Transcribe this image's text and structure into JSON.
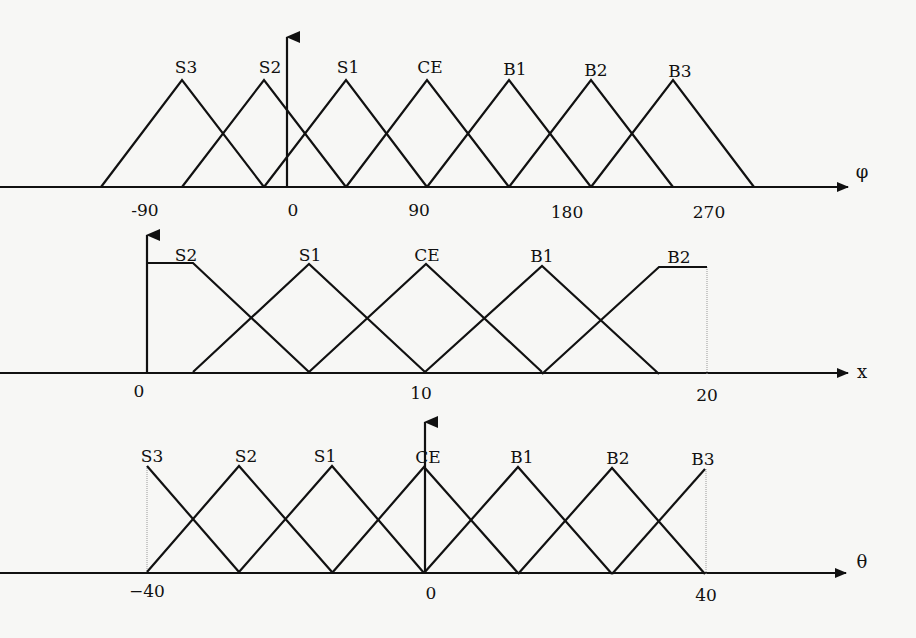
{
  "colors": {
    "line": "#111111",
    "background": "#f7f7f5",
    "guide": "#999999"
  },
  "chart_data": [
    {
      "type": "membership-functions",
      "variable": "phi",
      "axis_label": "φ",
      "ticks": [
        {
          "label": "-90",
          "x": 145,
          "y": 216
        },
        {
          "label": "0",
          "x": 293,
          "y": 216
        },
        {
          "label": "90",
          "x": 419,
          "y": 216
        },
        {
          "label": "180",
          "x": 567,
          "y": 218
        },
        {
          "label": "270",
          "x": 709,
          "y": 218
        }
      ],
      "sets": [
        {
          "name": "S3",
          "points": [
            [
              101,
              187
            ],
            [
              182,
              80
            ],
            [
              264,
              187
            ]
          ]
        },
        {
          "name": "S2",
          "points": [
            [
              182,
              187
            ],
            [
              264,
              80
            ],
            [
              346,
              187
            ]
          ]
        },
        {
          "name": "S1",
          "points": [
            [
              264,
              187
            ],
            [
              346,
              80
            ],
            [
              427,
              187
            ]
          ]
        },
        {
          "name": "CE",
          "points": [
            [
              346,
              187
            ],
            [
              427,
              80
            ],
            [
              509,
              187
            ]
          ]
        },
        {
          "name": "B1",
          "points": [
            [
              427,
              187
            ],
            [
              509,
              80
            ],
            [
              591,
              187
            ]
          ]
        },
        {
          "name": "B2",
          "points": [
            [
              509,
              187
            ],
            [
              591,
              80
            ],
            [
              673,
              187
            ]
          ]
        },
        {
          "name": "B3",
          "points": [
            [
              591,
              187
            ],
            [
              673,
              80
            ],
            [
              754,
              187
            ]
          ]
        }
      ],
      "axis": {
        "y": 187,
        "x_start": 0,
        "x_end": 848,
        "yaxis_x": 287,
        "yaxis_top": 35
      },
      "axis_label_pos": {
        "x": 862,
        "y": 178
      }
    },
    {
      "type": "membership-functions",
      "variable": "x",
      "axis_label": "x",
      "ticks": [
        {
          "label": "0",
          "x": 139,
          "y": 397
        },
        {
          "label": "10",
          "x": 421,
          "y": 399
        },
        {
          "label": "20",
          "x": 707,
          "y": 401
        }
      ],
      "sets": [
        {
          "name": "S2",
          "points": [
            [
              147,
              263
            ],
            [
              193,
              263
            ],
            [
              309,
              372
            ]
          ],
          "label_x": 186
        },
        {
          "name": "S1",
          "points": [
            [
              193,
              372
            ],
            [
              309,
              264
            ],
            [
              425,
              372
            ]
          ],
          "label_x": 310
        },
        {
          "name": "CE",
          "points": [
            [
              309,
              372
            ],
            [
              426,
              264
            ],
            [
              542,
              372
            ]
          ],
          "label_x": 427
        },
        {
          "name": "B1",
          "points": [
            [
              425,
              372
            ],
            [
              542,
              266
            ],
            [
              659,
              374
            ]
          ],
          "label_x": 542
        },
        {
          "name": "B2",
          "points": [
            [
              542,
              374
            ],
            [
              659,
              267
            ],
            [
              707,
              267
            ]
          ],
          "label_x": 678
        }
      ],
      "axis": {
        "y": 373,
        "x_start": 0,
        "x_end": 848,
        "yaxis_x": 147,
        "yaxis_top": 233
      },
      "guides": [
        {
          "x": 707,
          "y1": 267,
          "y2": 374
        }
      ],
      "axis_label_pos": {
        "x": 862,
        "y": 378
      }
    },
    {
      "type": "membership-functions",
      "variable": "theta",
      "axis_label": "θ",
      "ticks": [
        {
          "label": "−40",
          "x": 147,
          "y": 597
        },
        {
          "label": "0",
          "x": 431,
          "y": 599
        },
        {
          "label": "40",
          "x": 706,
          "y": 601
        }
      ],
      "sets": [
        {
          "name": "S3",
          "points": [
            [
              147,
              466
            ],
            [
              239,
              572
            ]
          ]
        },
        {
          "name": "S2",
          "points": [
            [
              147,
              572
            ],
            [
              239,
              466
            ],
            [
              332,
              572
            ]
          ]
        },
        {
          "name": "S1",
          "points": [
            [
              239,
              572
            ],
            [
              332,
              466
            ],
            [
              424,
              573
            ]
          ]
        },
        {
          "name": "CE",
          "points": [
            [
              332,
              573
            ],
            [
              424,
              467
            ],
            [
              518,
              573
            ]
          ]
        },
        {
          "name": "B1",
          "points": [
            [
              424,
              573
            ],
            [
              518,
              467
            ],
            [
              612,
              574
            ]
          ]
        },
        {
          "name": "B2",
          "points": [
            [
              518,
              574
            ],
            [
              612,
              468
            ],
            [
              705,
              574
            ]
          ]
        },
        {
          "name": "B3",
          "points": [
            [
              612,
              574
            ],
            [
              705,
              469
            ]
          ]
        }
      ],
      "peaks_x": [
        152,
        251,
        334,
        425,
        519,
        616,
        702
      ],
      "axis": {
        "y": 573,
        "x_start": 0,
        "x_end": 846,
        "yaxis_x": 425,
        "yaxis_top": 420
      },
      "guides": [
        {
          "x": 147,
          "y1": 466,
          "y2": 572
        },
        {
          "x": 706,
          "y1": 469,
          "y2": 574
        }
      ],
      "axis_label_pos": {
        "x": 862,
        "y": 568
      }
    }
  ],
  "labels": {
    "phi": [
      {
        "text": "S3",
        "x": 186,
        "y": 73
      },
      {
        "text": "S2",
        "x": 270,
        "y": 73
      },
      {
        "text": "S1",
        "x": 348,
        "y": 73
      },
      {
        "text": "CE",
        "x": 430,
        "y": 73
      },
      {
        "text": "B1",
        "x": 515,
        "y": 75
      },
      {
        "text": "B2",
        "x": 596,
        "y": 76
      },
      {
        "text": "B3",
        "x": 680,
        "y": 77
      }
    ],
    "x": [
      {
        "text": "S2",
        "x": 186,
        "y": 261
      },
      {
        "text": "S1",
        "x": 310,
        "y": 261
      },
      {
        "text": "CE",
        "x": 427,
        "y": 261
      },
      {
        "text": "B1",
        "x": 542,
        "y": 262
      },
      {
        "text": "B2",
        "x": 679,
        "y": 263
      }
    ],
    "theta": [
      {
        "text": "S3",
        "x": 152,
        "y": 462
      },
      {
        "text": "S2",
        "x": 246,
        "y": 462
      },
      {
        "text": "S1",
        "x": 325,
        "y": 462
      },
      {
        "text": "CE",
        "x": 428,
        "y": 463
      },
      {
        "text": "B1",
        "x": 522,
        "y": 463
      },
      {
        "text": "B2",
        "x": 618,
        "y": 464
      },
      {
        "text": "B3",
        "x": 703,
        "y": 465
      }
    ]
  }
}
